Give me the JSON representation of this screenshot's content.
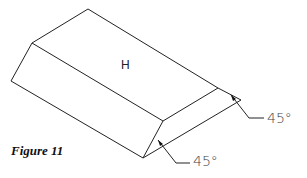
{
  "figure": {
    "caption": "Figure 11",
    "face_label": "H",
    "annotations": [
      {
        "id": "angle-right",
        "text": "45°"
      },
      {
        "id": "angle-bottom",
        "text": "45°"
      }
    ],
    "stroke_color": "#222222"
  }
}
